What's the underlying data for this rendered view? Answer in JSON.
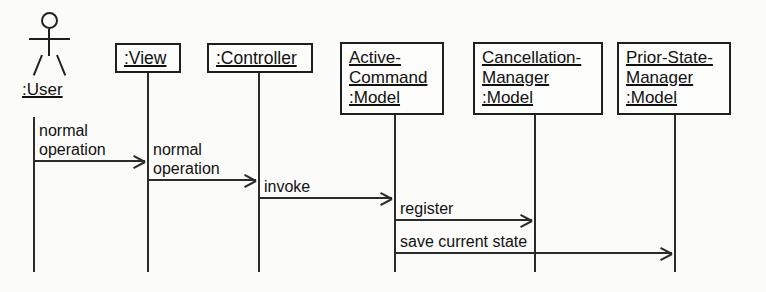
{
  "diagram": {
    "type": "uml-sequence-diagram",
    "background_color": "#fbfbf9",
    "line_color": "#2b2b2b",
    "text_color": "#111111",
    "actor": {
      "name": "actor-user",
      "label": ":User",
      "icon": "stick-figure-icon"
    },
    "participants": [
      {
        "name": "view",
        "lines": [
          ":View"
        ]
      },
      {
        "name": "controller",
        "lines": [
          ":Controller"
        ]
      },
      {
        "name": "active-command",
        "lines": [
          "Active-",
          "Command",
          ":Model"
        ]
      },
      {
        "name": "cancellation-manager",
        "lines": [
          "Cancellation-",
          "Manager",
          ":Model"
        ]
      },
      {
        "name": "prior-state-manager",
        "lines": [
          "Prior-State-",
          "Manager",
          ":Model"
        ]
      }
    ],
    "messages": [
      {
        "name": "message-normal-operation-user-view",
        "label_lines": [
          "normal",
          "operation"
        ],
        "from": ":User",
        "to": ":View"
      },
      {
        "name": "message-normal-operation-view-controller",
        "label_lines": [
          "normal",
          "operation"
        ],
        "from": ":View",
        "to": ":Controller"
      },
      {
        "name": "message-invoke",
        "label_lines": [
          "invoke"
        ],
        "from": ":Controller",
        "to": "Active-Command:Model"
      },
      {
        "name": "message-register",
        "label_lines": [
          "register"
        ],
        "from": "Active-Command:Model",
        "to": "Cancellation-Manager:Model"
      },
      {
        "name": "message-save-current-state",
        "label_lines": [
          "save current state"
        ],
        "from": "Active-Command:Model",
        "to": "Prior-State-Manager:Model"
      }
    ]
  }
}
